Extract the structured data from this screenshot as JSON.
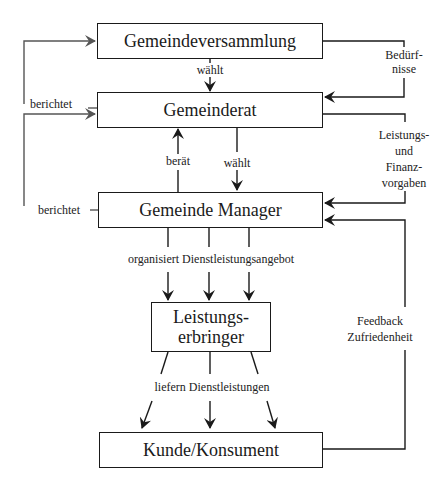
{
  "nodes": {
    "assembly": {
      "label": "Gemeindeversammlung"
    },
    "council": {
      "label": "Gemeinderat"
    },
    "manager": {
      "label": "Gemeinde Manager"
    },
    "provider": {
      "label": "Leistungs-\nerbringer"
    },
    "customer": {
      "label": "Kunde/Konsument"
    }
  },
  "edges": {
    "assembly_elects_council": "wählt",
    "council_reports_assembly": "berichtet",
    "manager_reports_council": "berichtet",
    "manager_advises_council": "berät",
    "council_elects_manager": "wählt",
    "needs": "Bedürf-\nnisse",
    "performance_finance": "Leistungs-\nund Finanz-\nvorgaben",
    "manager_organizes": "organisiert Dienstleistungsangebot",
    "providers_deliver": "liefern Dienstleistungen",
    "feedback": "Feedback\nZufriedenheit"
  },
  "colors": {
    "line": "#1a1a1a",
    "background": "#ffffff"
  }
}
